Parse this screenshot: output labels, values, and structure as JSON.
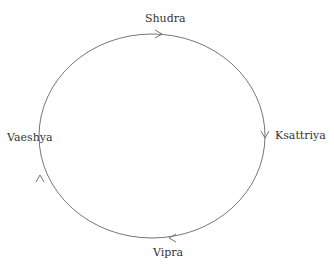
{
  "diagram": {
    "type": "cycle",
    "stroke_color": "#666666",
    "text_color": "#333333",
    "nodes": {
      "top": "Shudra",
      "right": "Ksattriya",
      "bottom": "Vipra",
      "left": "Vaeshya"
    },
    "direction": "clockwise",
    "edges": [
      {
        "from": "Vaeshya",
        "to": "Shudra"
      },
      {
        "from": "Shudra",
        "to": "Ksattriya"
      },
      {
        "from": "Ksattriya",
        "to": "Vipra"
      },
      {
        "from": "Vipra",
        "to": "Vaeshya"
      }
    ]
  }
}
